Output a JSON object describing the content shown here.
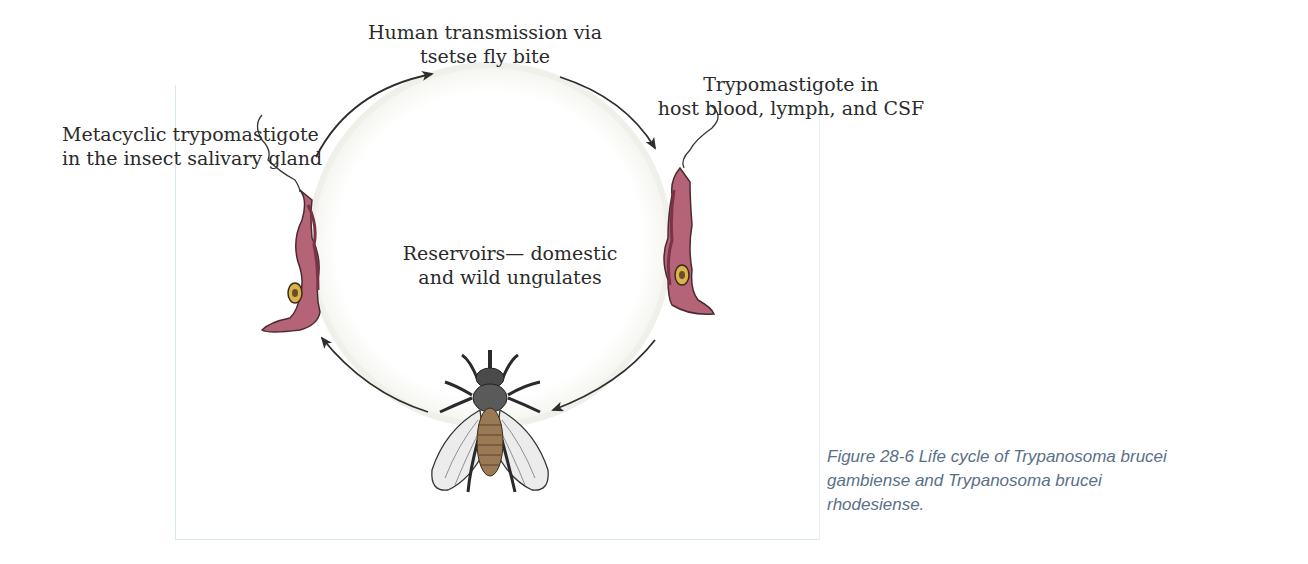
{
  "figure": {
    "labels": {
      "top": [
        "Human transmission via",
        "tsetse fly bite"
      ],
      "left": [
        "Metacyclic trypomastigote",
        "in the insect salivary gland"
      ],
      "right": [
        "Trypomastigote in",
        "host blood, lymph, and CSF"
      ],
      "center": [
        "Reservoirs— domestic",
        "and wild ungulates"
      ]
    },
    "caption": [
      "Figure 28-6 Life cycle of Trypanosoma brucei",
      "gambiense and Trypanosoma brucei",
      "rhodesiense."
    ],
    "icons": {
      "left_organism": "trypanosome-icon",
      "right_organism": "trypanosome-icon",
      "vector": "tsetse-fly-icon"
    },
    "colors": {
      "parasite_body": "#b56478",
      "parasite_dark": "#7a3346",
      "nucleus": "#d9b44a",
      "arrow": "#2e2e2e",
      "caption": "#5a7088",
      "frame_border": "#d6eaf0"
    }
  }
}
